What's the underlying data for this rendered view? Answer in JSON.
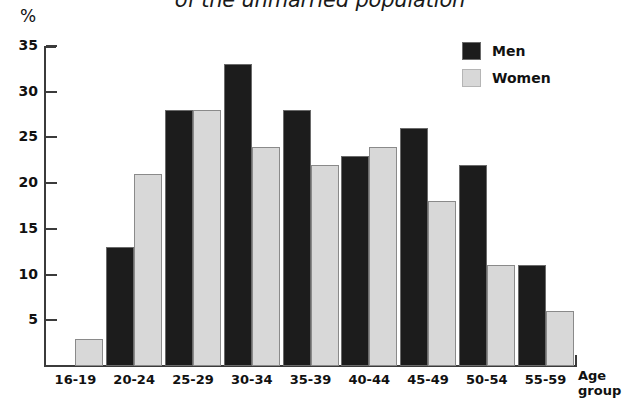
{
  "chart_data": {
    "type": "bar",
    "title": "of the unmarried population",
    "title_line1": "",
    "xlabel": "Age group",
    "ylabel": "%",
    "categories": [
      "16-19",
      "20-24",
      "25-29",
      "30-34",
      "35-39",
      "40-44",
      "45-49",
      "50-54",
      "55-59"
    ],
    "series": [
      {
        "name": "Men",
        "values": [
          0,
          13,
          28,
          33,
          28,
          23,
          26,
          22,
          11
        ]
      },
      {
        "name": "Women",
        "values": [
          3,
          21,
          28,
          24,
          22,
          24,
          18,
          11,
          6
        ]
      }
    ],
    "ylim": [
      0,
      35
    ],
    "yticks": [
      5,
      10,
      15,
      20,
      25,
      30,
      35
    ],
    "grid": false,
    "legend_position": "top-right",
    "colors": {
      "men": "#1c1c1c",
      "women": "#d8d8d8",
      "axis": "#3b3b3b"
    }
  },
  "axis": {
    "unit_label": "%",
    "x_title_line1": "Age",
    "x_title_line2": "group"
  },
  "legend": {
    "items": [
      {
        "label": "Men"
      },
      {
        "label": "Women"
      }
    ]
  }
}
